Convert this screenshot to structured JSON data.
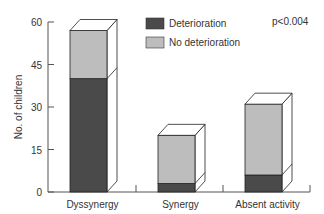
{
  "chart_data": {
    "type": "bar",
    "stacked": true,
    "style": "3d-box",
    "title": "",
    "xlabel": "",
    "ylabel": "No. of children",
    "ylim": [
      0,
      60
    ],
    "yticks": [
      0,
      15,
      30,
      45,
      60
    ],
    "categories": [
      "Dyssynergy",
      "Synergy",
      "Absent activity"
    ],
    "series": [
      {
        "name": "Deterioration",
        "color": "#4a4a4a",
        "values": [
          40,
          3,
          6
        ]
      },
      {
        "name": "No deterioration",
        "color": "#bdbdbd",
        "values": [
          17,
          17,
          25
        ]
      }
    ],
    "totals": [
      57,
      20,
      31
    ],
    "annotation": "p<0.004",
    "legend_position": "top-center",
    "grid": false
  },
  "labels": {
    "ylabel": "No. of children",
    "legend_0": "Deterioration",
    "legend_1": "No deterioration",
    "annotation": "p<0.004",
    "yt0": "0",
    "yt1": "15",
    "yt2": "30",
    "yt3": "45",
    "yt4": "60",
    "cat0": "Dyssynergy",
    "cat1": "Synergy",
    "cat2": "Absent activity"
  }
}
